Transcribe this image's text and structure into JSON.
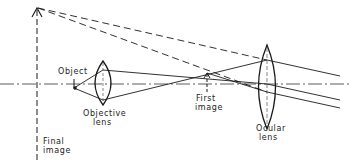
{
  "diagram": {
    "labels": {
      "object": "Object",
      "objective_line1": "Objective",
      "objective_line2": "lens",
      "first_image_line1": "First",
      "first_image_line2": "image",
      "ocular_line1": "Ocular",
      "ocular_line2": "lens",
      "final_image_line1": "Final",
      "final_image_line2": "image"
    },
    "colors": {
      "ink": "#1a1a1a",
      "background": "#ffffff"
    }
  }
}
